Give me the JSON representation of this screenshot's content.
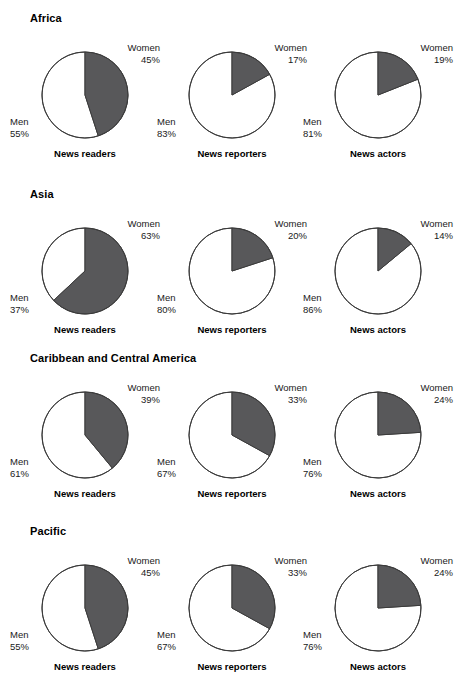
{
  "figure": {
    "slice_colors": {
      "women": "#58585a",
      "men": "#ffffff",
      "outline": "#3b3b3b"
    },
    "column_captions": [
      "News readers",
      "News reporters",
      "News actors"
    ],
    "legend_terms": {
      "women": "Women",
      "men": "Men"
    }
  },
  "chart_data": {
    "type": "pie",
    "title": "",
    "legend_position": "none",
    "grid": false,
    "categories": [
      "Women",
      "Men"
    ],
    "panels": [
      {
        "region": "Africa",
        "charts": [
          {
            "caption": "News readers",
            "women_label": "Women",
            "women_value": 45,
            "women_pct": "45%",
            "men_label": "Men",
            "men_value": 55,
            "men_pct": "55%"
          },
          {
            "caption": "News reporters",
            "women_label": "Women",
            "women_value": 17,
            "women_pct": "17%",
            "men_label": "Men",
            "men_value": 83,
            "men_pct": "83%"
          },
          {
            "caption": "News actors",
            "women_label": "Women",
            "women_value": 19,
            "women_pct": "19%",
            "men_label": "Men",
            "men_value": 81,
            "men_pct": "81%"
          }
        ]
      },
      {
        "region": "Asia",
        "charts": [
          {
            "caption": "News readers",
            "women_label": "Women",
            "women_value": 63,
            "women_pct": "63%",
            "men_label": "Men",
            "men_value": 37,
            "men_pct": "37%"
          },
          {
            "caption": "News reporters",
            "women_label": "Women",
            "women_value": 20,
            "women_pct": "20%",
            "men_label": "Men",
            "men_value": 80,
            "men_pct": "80%"
          },
          {
            "caption": "News actors",
            "women_label": "Women",
            "women_value": 14,
            "women_pct": "14%",
            "men_label": "Men",
            "men_value": 86,
            "men_pct": "86%"
          }
        ]
      },
      {
        "region": "Caribbean and Central America",
        "charts": [
          {
            "caption": "News readers",
            "women_label": "Women",
            "women_value": 39,
            "women_pct": "39%",
            "men_label": "Men",
            "men_value": 61,
            "men_pct": "61%"
          },
          {
            "caption": "News reporters",
            "women_label": "Women",
            "women_value": 33,
            "women_pct": "33%",
            "men_label": "Men",
            "men_value": 67,
            "men_pct": "67%"
          },
          {
            "caption": "News actors",
            "women_label": "Women",
            "women_value": 24,
            "women_pct": "24%",
            "men_label": "Men",
            "men_value": 76,
            "men_pct": "76%"
          }
        ]
      },
      {
        "region": "Pacific",
        "charts": [
          {
            "caption": "News readers",
            "women_label": "Women",
            "women_value": 45,
            "women_pct": "45%",
            "men_label": "Men",
            "men_value": 55,
            "men_pct": "55%"
          },
          {
            "caption": "News reporters",
            "women_label": "Women",
            "women_value": 33,
            "women_pct": "33%",
            "men_label": "Men",
            "men_value": 67,
            "men_pct": "67%"
          },
          {
            "caption": "News actors",
            "women_label": "Women",
            "women_value": 24,
            "women_pct": "24%",
            "men_label": "Men",
            "men_value": 76,
            "men_pct": "76%"
          }
        ]
      }
    ]
  }
}
